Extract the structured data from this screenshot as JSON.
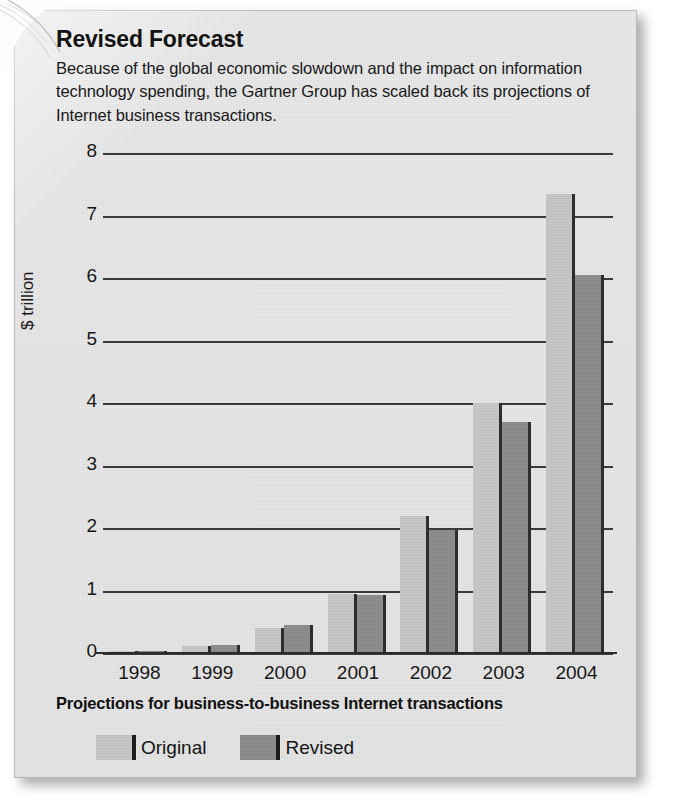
{
  "header": {
    "title": "Revised Forecast",
    "description": "Because of the global economic slowdown and the impact on information technology spending, the Gartner Group has scaled back its projections of Internet business transactions."
  },
  "caption": "Projections for business-to-business Internet transactions",
  "legend": {
    "items": [
      {
        "label": "Original",
        "color": "#c9c9c9"
      },
      {
        "label": "Revised",
        "color": "#8f8f8f"
      }
    ]
  },
  "colors": {
    "paper": "#ececec",
    "ink": "#171717",
    "gridline": "#3a3a3a",
    "original_bar": "#c9c9c9",
    "revised_bar": "#8f8f8f",
    "bar_edge": "#2d2d2d"
  },
  "chart_data": {
    "type": "bar",
    "title": "Revised Forecast",
    "subtitle": "Because of the global economic slowdown and the impact on information technology spending, the Gartner Group has scaled back its projections of Internet business transactions.",
    "xlabel": "Projections for business-to-business Internet transactions",
    "ylabel": "$ trillion",
    "categories": [
      "1998",
      "1999",
      "2000",
      "2001",
      "2002",
      "2003",
      "2004"
    ],
    "series": [
      {
        "name": "Original",
        "color": "#c9c9c9",
        "values": [
          0.03,
          0.12,
          0.4,
          0.95,
          2.2,
          4.0,
          7.35
        ]
      },
      {
        "name": "Revised",
        "color": "#8f8f8f",
        "values": [
          0.03,
          0.13,
          0.45,
          0.93,
          1.97,
          3.7,
          6.05
        ]
      }
    ],
    "ylim": [
      0,
      8
    ],
    "yticks": [
      0,
      1,
      2,
      3,
      4,
      5,
      6,
      7,
      8
    ],
    "ytick_labels": [
      "0",
      "1",
      "2",
      "3",
      "4",
      "5",
      "6",
      "7",
      "8"
    ],
    "grid": true,
    "legend_position": "bottom-left"
  }
}
